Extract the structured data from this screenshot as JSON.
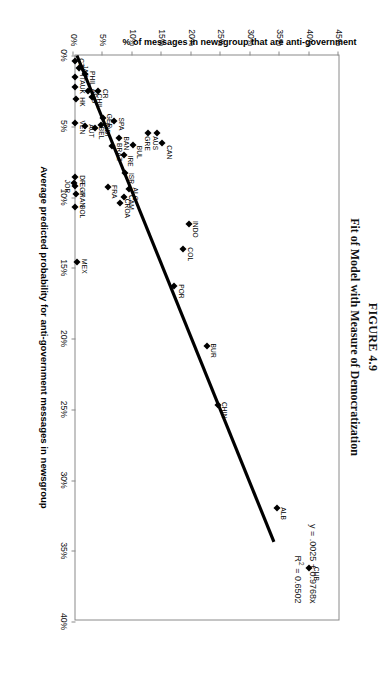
{
  "figure": {
    "number": "FIGURE 4.9",
    "title": "Fit of Model with Measure of Democratization"
  },
  "annotation": {
    "equation": "y = .0025 + 0.9768x",
    "r_squared_prefix": "R",
    "r_squared_exp": "2",
    "r_squared_value": " = 0.6502"
  },
  "chart_data": {
    "type": "scatter",
    "title": "Fit of Model with Measure of Democratization",
    "xlabel": "Average predicted probability for anti-government messages in newsgroup",
    "ylabel": "% of messages in newsgroup that are anti-government",
    "xlim": [
      0,
      0.4
    ],
    "ylim": [
      0,
      0.45
    ],
    "xticks": [
      "0%",
      "5%",
      "10%",
      "15%",
      "20%",
      "25%",
      "30%",
      "35%",
      "40%"
    ],
    "xtick_values": [
      0,
      0.05,
      0.1,
      0.15,
      0.2,
      0.25,
      0.3,
      0.35,
      0.4
    ],
    "yticks": [
      "0%",
      "5%",
      "10%",
      "15%",
      "20%",
      "25%",
      "30%",
      "35%",
      "40%",
      "45%"
    ],
    "ytick_values": [
      0,
      0.05,
      0.1,
      0.15,
      0.2,
      0.25,
      0.3,
      0.35,
      0.4,
      0.45
    ],
    "grid": false,
    "legend": false,
    "fit_line": {
      "equation": "y = .0025 + 0.9768x",
      "intercept": 0.0025,
      "slope": 0.9768,
      "r_squared": 0.6502,
      "x_start": 0.0,
      "x_end": 0.345
    },
    "points": [
      {
        "label": "CUB",
        "x": 0.362,
        "y": 0.4,
        "lx": -1,
        "ly": -9
      },
      {
        "label": "ALB",
        "x": 0.32,
        "y": 0.345,
        "lx": -1,
        "ly": -9
      },
      {
        "label": "CHIN",
        "x": 0.247,
        "y": 0.245,
        "lx": -3,
        "ly": -9
      },
      {
        "label": "BUR",
        "x": 0.205,
        "y": 0.226,
        "lx": -2,
        "ly": -9
      },
      {
        "label": "POR",
        "x": 0.163,
        "y": 0.171,
        "lx": -2,
        "ly": -9
      },
      {
        "label": "COL",
        "x": 0.137,
        "y": 0.186,
        "lx": -2,
        "ly": -9
      },
      {
        "label": "INDO",
        "x": 0.119,
        "y": 0.196,
        "lx": -3,
        "ly": -9
      },
      {
        "label": "MEX",
        "x": 0.146,
        "y": 0.006,
        "lx": -3,
        "ly": -9
      },
      {
        "label": "CAN",
        "x": 0.062,
        "y": 0.151,
        "lx": 2,
        "ly": -9
      },
      {
        "label": "AUS",
        "x": 0.055,
        "y": 0.141,
        "lx": 3,
        "ly": -1
      },
      {
        "label": "GRE",
        "x": 0.055,
        "y": 0.127,
        "lx": 3,
        "ly": -1
      },
      {
        "label": "BUL",
        "x": 0.063,
        "y": 0.101,
        "lx": 1,
        "ly": -9
      },
      {
        "label": "IRE",
        "x": 0.07,
        "y": 0.085,
        "lx": 1,
        "ly": -9
      },
      {
        "label": "ISR",
        "x": 0.083,
        "y": 0.087,
        "lx": 0,
        "ly": -9
      },
      {
        "label": "ALG",
        "x": 0.094,
        "y": 0.094,
        "lx": -1,
        "ly": -9
      },
      {
        "label": "CAM",
        "x": 0.1,
        "y": 0.086,
        "lx": -2,
        "ly": -9
      },
      {
        "label": "CROA",
        "x": 0.104,
        "y": 0.079,
        "lx": -4,
        "ly": -9
      },
      {
        "label": "FRA",
        "x": 0.093,
        "y": 0.058,
        "lx": -2,
        "ly": -9
      },
      {
        "label": "BAN",
        "x": 0.058,
        "y": 0.078,
        "lx": -1,
        "ly": -9
      },
      {
        "label": "BRAZ",
        "x": 0.064,
        "y": 0.066,
        "lx": -3,
        "ly": -9
      },
      {
        "label": "SPA",
        "x": 0.046,
        "y": 0.069,
        "lx": -3,
        "ly": -9
      },
      {
        "label": "GER",
        "x": 0.044,
        "y": 0.05,
        "lx": -4,
        "ly": -9
      },
      {
        "label": "INDI",
        "x": 0.049,
        "y": 0.046,
        "lx": -2,
        "ly": -9
      },
      {
        "label": "BEL",
        "x": 0.051,
        "y": 0.036,
        "lx": -1,
        "ly": -9
      },
      {
        "label": "AUT",
        "x": 0.05,
        "y": 0.019,
        "lx": -2,
        "ly": -9
      },
      {
        "label": "VEN",
        "x": 0.048,
        "y": 0.003,
        "lx": -3,
        "ly": -9
      },
      {
        "label": "CR",
        "x": 0.025,
        "y": 0.042,
        "lx": -2,
        "ly": -9
      },
      {
        "label": "CHIL",
        "x": 0.029,
        "y": 0.032,
        "lx": -3,
        "ly": -9
      },
      {
        "label": "ARG",
        "x": 0.025,
        "y": 0.024,
        "lx": -2,
        "ly": -9
      },
      {
        "label": "PHIL",
        "x": 0.013,
        "y": 0.02,
        "lx": -3,
        "ly": -9
      },
      {
        "label": "JAP",
        "x": 0.009,
        "y": 0.009,
        "lx": -3,
        "ly": -9
      },
      {
        "label": "HK",
        "x": 0.031,
        "y": 0.004,
        "lx": -2,
        "ly": -9
      },
      {
        "label": "ITA",
        "x": 0.015,
        "y": 0.003,
        "lx": -2,
        "ly": -9
      },
      {
        "label": "UK",
        "x": 0.022,
        "y": 0.003,
        "lx": -2,
        "ly": -9
      },
      {
        "label": "CZE",
        "x": 0.004,
        "y": 0.002,
        "lx": -3,
        "ly": -9
      },
      {
        "label": "DR",
        "x": 0.086,
        "y": 0.003,
        "lx": -2,
        "ly": -9
      },
      {
        "label": "EGY",
        "x": 0.092,
        "y": 0.003,
        "lx": -3,
        "ly": -9
      },
      {
        "label": "IRAN",
        "x": 0.098,
        "y": 0.004,
        "lx": -3,
        "ly": -9
      },
      {
        "label": "JOR",
        "x": 0.09,
        "y": 0.001,
        "lx": -3,
        "ly": 5
      },
      {
        "label": "BOL",
        "x": 0.107,
        "y": 0.003,
        "lx": -2,
        "ly": -9
      }
    ]
  }
}
